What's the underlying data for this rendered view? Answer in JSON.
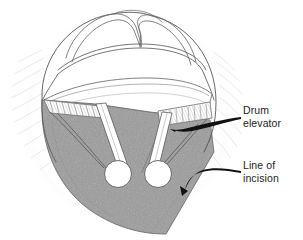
{
  "figure": {
    "kind": "surgical-line-drawing",
    "background_color": "#ffffff",
    "ink_color": "#3a3a3a",
    "shade_color": "#9b9b9b",
    "shade_edge_color": "#6e6e6e",
    "callout_color": "#111111",
    "text_color": "#1c1c1c"
  },
  "labels": [
    {
      "id": "drum-elevator",
      "line1": "Drum",
      "line2": "elevator",
      "text": "Drum\nelevator"
    },
    {
      "id": "line-of-incision",
      "line1": "Line of",
      "line2": "incision",
      "text": "Line of\nincision"
    }
  ]
}
